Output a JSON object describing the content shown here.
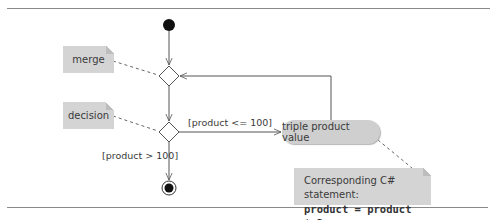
{
  "diagram": {
    "type": "UML activity diagram",
    "notes": {
      "merge": "merge",
      "decision": "decision",
      "statement_title": "Corresponding C# statement:",
      "statement_code": "product = product * 3;"
    },
    "activity": {
      "label": "triple product value"
    },
    "guards": {
      "loop": "[product <= 100]",
      "exit": "[product > 100]"
    },
    "nodes": [
      "initial-node",
      "merge-node",
      "decision-node",
      "action-state",
      "final-node"
    ],
    "colors": {
      "note_fill": "#d4d4d4",
      "activity_fill": "#cfcfcf",
      "line": "#555555",
      "node_fill": "#111111"
    }
  }
}
